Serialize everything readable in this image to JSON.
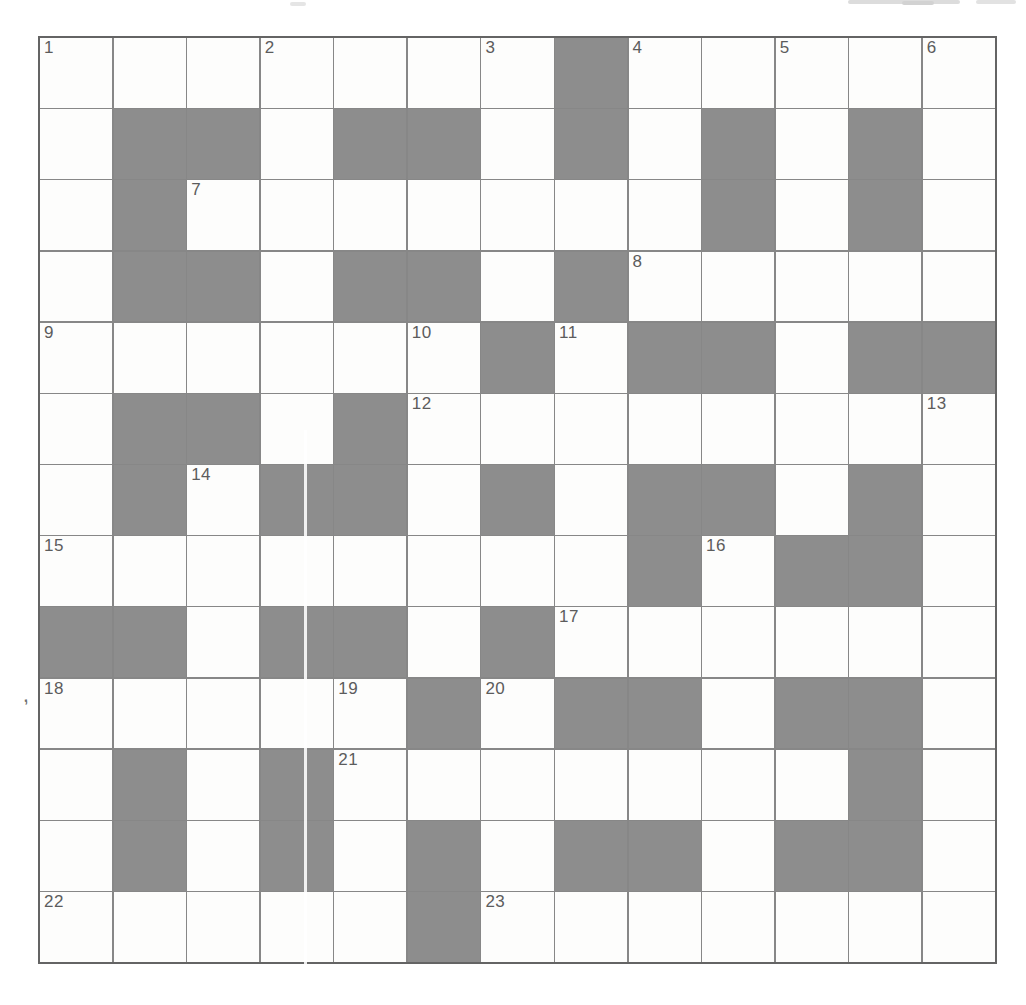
{
  "puzzle": {
    "kind": "crossword-grid",
    "rows": 13,
    "cols": 13,
    "black_cells": [
      [
        0,
        7
      ],
      [
        1,
        1
      ],
      [
        1,
        2
      ],
      [
        1,
        4
      ],
      [
        1,
        5
      ],
      [
        1,
        7
      ],
      [
        1,
        9
      ],
      [
        1,
        11
      ],
      [
        2,
        1
      ],
      [
        2,
        9
      ],
      [
        2,
        11
      ],
      [
        3,
        1
      ],
      [
        3,
        2
      ],
      [
        3,
        4
      ],
      [
        3,
        5
      ],
      [
        3,
        7
      ],
      [
        4,
        6
      ],
      [
        4,
        8
      ],
      [
        4,
        9
      ],
      [
        4,
        11
      ],
      [
        4,
        12
      ],
      [
        5,
        1
      ],
      [
        5,
        2
      ],
      [
        5,
        4
      ],
      [
        6,
        1
      ],
      [
        6,
        3
      ],
      [
        6,
        4
      ],
      [
        6,
        6
      ],
      [
        6,
        8
      ],
      [
        6,
        9
      ],
      [
        6,
        11
      ],
      [
        7,
        8
      ],
      [
        7,
        10
      ],
      [
        7,
        11
      ],
      [
        8,
        0
      ],
      [
        8,
        1
      ],
      [
        8,
        3
      ],
      [
        8,
        4
      ],
      [
        8,
        6
      ],
      [
        9,
        5
      ],
      [
        9,
        7
      ],
      [
        9,
        8
      ],
      [
        9,
        10
      ],
      [
        9,
        11
      ],
      [
        10,
        1
      ],
      [
        10,
        3
      ],
      [
        10,
        11
      ],
      [
        11,
        1
      ],
      [
        11,
        3
      ],
      [
        11,
        5
      ],
      [
        11,
        7
      ],
      [
        11,
        8
      ],
      [
        11,
        10
      ],
      [
        11,
        11
      ],
      [
        12,
        5
      ]
    ],
    "numbers": [
      {
        "num": "1",
        "row": 0,
        "col": 0
      },
      {
        "num": "2",
        "row": 0,
        "col": 3
      },
      {
        "num": "3",
        "row": 0,
        "col": 6
      },
      {
        "num": "4",
        "row": 0,
        "col": 8
      },
      {
        "num": "5",
        "row": 0,
        "col": 10
      },
      {
        "num": "6",
        "row": 0,
        "col": 12
      },
      {
        "num": "7",
        "row": 2,
        "col": 2
      },
      {
        "num": "8",
        "row": 3,
        "col": 8
      },
      {
        "num": "9",
        "row": 4,
        "col": 0
      },
      {
        "num": "10",
        "row": 4,
        "col": 5
      },
      {
        "num": "11",
        "row": 4,
        "col": 7
      },
      {
        "num": "12",
        "row": 5,
        "col": 5
      },
      {
        "num": "13",
        "row": 5,
        "col": 12
      },
      {
        "num": "14",
        "row": 6,
        "col": 2
      },
      {
        "num": "15",
        "row": 7,
        "col": 0
      },
      {
        "num": "16",
        "row": 7,
        "col": 9
      },
      {
        "num": "17",
        "row": 8,
        "col": 7
      },
      {
        "num": "18",
        "row": 9,
        "col": 0
      },
      {
        "num": "19",
        "row": 9,
        "col": 4
      },
      {
        "num": "20",
        "row": 9,
        "col": 6
      },
      {
        "num": "21",
        "row": 10,
        "col": 4
      },
      {
        "num": "22",
        "row": 12,
        "col": 0
      },
      {
        "num": "23",
        "row": 12,
        "col": 6
      }
    ]
  },
  "colors": {
    "page_bg": "#ffffff",
    "cell_bg": "#fdfdfc",
    "block": "#8d8d8d",
    "grid_line": "#878787",
    "outer_border": "#646464",
    "number": "#5c5c5c"
  },
  "artifacts": {
    "comma_mark": ","
  }
}
